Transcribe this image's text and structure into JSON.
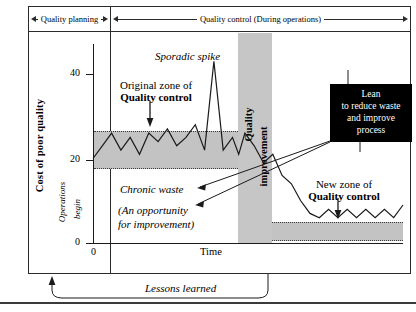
{
  "figure": {
    "title_role": "juran-trilogy-diagram"
  },
  "phases": [
    {
      "label": "Quality planning",
      "arrows": "both"
    },
    {
      "label": "Quality control (During operations)",
      "arrows": "both"
    }
  ],
  "axes": {
    "y_title": "Cost of poor quality",
    "y_ticks": [
      "40",
      "20",
      "0"
    ],
    "x_title": "Time",
    "x_origin": "0"
  },
  "annotations": {
    "operations_begin_line1": "Operations",
    "operations_begin_line2": "begin",
    "sporadic_spike": "Sporadic spike",
    "original_zone_line1": "Original zone of",
    "original_zone_line2": "Quality control",
    "new_zone_line1": "New zone of",
    "new_zone_line2": "Quality control",
    "chronic_waste": "Chronic waste",
    "opportunity_line1": "(An opportunity",
    "opportunity_line2": "for improvement)",
    "lessons_learned": "Lessons learned",
    "improvement_band_line1": "Quality",
    "improvement_band_line2": "improvement"
  },
  "callout": {
    "line1": "Lean",
    "line2": "to reduce waste",
    "line3": "and improve",
    "line4": "process"
  },
  "colors": {
    "zone_fill": "#c3c3c3",
    "band_fill": "#c6c6c6",
    "callout_bg": "#000000",
    "callout_text": "#ffffff",
    "line": "#1a1a1a"
  },
  "chart_data": {
    "type": "line",
    "xlabel": "Time",
    "ylabel": "Cost of poor quality",
    "ylim": [
      0,
      48
    ],
    "xlim": [
      0,
      100
    ],
    "grid": false,
    "legend": "none",
    "series": [
      {
        "name": "Cost of poor quality",
        "x": [
          0,
          3,
          6,
          9,
          12,
          15,
          18,
          21,
          24,
          27,
          30,
          33,
          36,
          39,
          42,
          45,
          47,
          49,
          52,
          55,
          58,
          61,
          64,
          67,
          70,
          73,
          76,
          79,
          82,
          85,
          88,
          91,
          94,
          97,
          100
        ],
        "y": [
          20,
          23,
          26,
          22,
          25,
          21,
          26,
          24,
          27,
          23,
          25,
          28,
          22,
          43,
          22,
          25,
          21,
          26,
          23,
          19,
          21,
          16,
          14,
          10,
          7,
          6,
          8,
          6,
          8,
          6,
          8,
          6,
          8,
          6,
          9
        ]
      }
    ],
    "bands": [
      {
        "name": "Original zone of Quality control",
        "y_low": 18,
        "y_high": 27,
        "x_from": 0,
        "x_to": 47
      },
      {
        "name": "New zone of Quality control",
        "y_low": 5,
        "y_high": 9,
        "x_from": 58,
        "x_to": 100
      },
      {
        "name": "Quality improvement",
        "orientation": "vertical",
        "x_from": 47,
        "x_to": 58
      }
    ]
  }
}
